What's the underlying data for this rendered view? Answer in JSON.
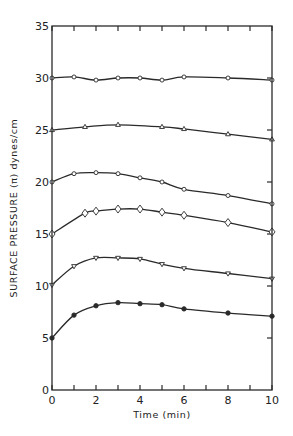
{
  "chart_data": {
    "type": "line",
    "title": "",
    "xlabel": "Time (min)",
    "ylabel": "SURFACE PRESSURE (π) dynes/cm",
    "xlim": [
      0,
      10
    ],
    "ylim": [
      0,
      35
    ],
    "xticks": [
      0,
      2,
      4,
      6,
      8,
      10
    ],
    "xminor_ticks": [
      1,
      3,
      5,
      7,
      9
    ],
    "yticks": [
      0,
      5,
      10,
      15,
      20,
      25,
      30,
      35
    ],
    "grid": false,
    "legend": null,
    "series": [
      {
        "name": "initial 30",
        "marker": "open-circle",
        "x": [
          0,
          1,
          2,
          3,
          4,
          5,
          6,
          8,
          10
        ],
        "y": [
          30.0,
          30.1,
          29.8,
          30.0,
          30.0,
          29.8,
          30.1,
          30.0,
          29.8
        ]
      },
      {
        "name": "initial 25",
        "marker": "open-triangle-up",
        "x": [
          0,
          1.5,
          3,
          5,
          6,
          8,
          10
        ],
        "y": [
          25.0,
          25.3,
          25.5,
          25.3,
          25.1,
          24.6,
          24.1
        ]
      },
      {
        "name": "initial 20",
        "marker": "open-circle",
        "x": [
          0,
          1,
          2,
          3,
          4,
          5,
          6,
          8,
          10
        ],
        "y": [
          20.0,
          20.8,
          20.9,
          20.8,
          20.4,
          20.0,
          19.3,
          18.7,
          17.9
        ]
      },
      {
        "name": "initial 15",
        "marker": "open-diamond",
        "x": [
          0,
          1.5,
          2,
          3,
          4,
          5,
          6,
          8,
          10
        ],
        "y": [
          15.0,
          17.0,
          17.2,
          17.4,
          17.4,
          17.1,
          16.8,
          16.1,
          15.2
        ]
      },
      {
        "name": "initial 10",
        "marker": "open-triangle-down",
        "x": [
          0,
          1,
          2,
          3,
          4,
          5,
          6,
          8,
          10
        ],
        "y": [
          10.1,
          11.9,
          12.7,
          12.7,
          12.6,
          12.1,
          11.7,
          11.2,
          10.7
        ]
      },
      {
        "name": "initial 5",
        "marker": "filled-circle",
        "x": [
          0,
          1,
          2,
          3,
          4,
          5,
          6,
          8,
          10
        ],
        "y": [
          5.0,
          7.2,
          8.1,
          8.4,
          8.3,
          8.2,
          7.8,
          7.4,
          7.1
        ]
      }
    ]
  },
  "colors": {
    "ink": "#2a2a2a",
    "background": "#ffffff"
  }
}
